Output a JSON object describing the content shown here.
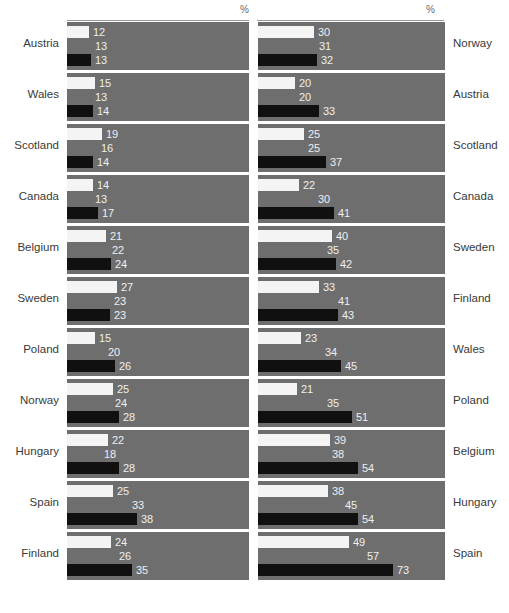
{
  "axis": {
    "unit_label_left": "%",
    "unit_label_right": "%"
  },
  "style": {
    "panel_background": "#6e6e6e",
    "series1_color": "#f4f4f4",
    "series2_color": "#6e6e6e",
    "series3_color": "#101010",
    "label_color": "#3a3a3a",
    "value_color": "#efefef"
  },
  "chart_data": {
    "type": "bar",
    "orientation": "horizontal",
    "title": "",
    "xlabel": "%",
    "ylabel": "",
    "grid": false,
    "legend_position": "none",
    "px_per_unit": 1.85,
    "panels": [
      {
        "name": "left",
        "unit": "%",
        "label_side": "left",
        "categories": [
          "Austria",
          "Wales",
          "Scotland",
          "Canada",
          "Belgium",
          "Sweden",
          "Poland",
          "Norway",
          "Hungary",
          "Spain",
          "Finland"
        ],
        "series": [
          {
            "name": "series-1",
            "color": "#f4f4f4",
            "values": [
              12,
              15,
              19,
              14,
              21,
              27,
              15,
              25,
              22,
              25,
              24
            ]
          },
          {
            "name": "series-2",
            "color": "#6e6e6e",
            "values": [
              13,
              13,
              16,
              13,
              22,
              23,
              20,
              24,
              18,
              33,
              26
            ]
          },
          {
            "name": "series-3",
            "color": "#101010",
            "values": [
              13,
              14,
              14,
              17,
              24,
              23,
              26,
              28,
              28,
              38,
              35
            ]
          }
        ]
      },
      {
        "name": "right",
        "unit": "%",
        "label_side": "right",
        "categories": [
          "Norway",
          "Austria",
          "Scotland",
          "Canada",
          "Sweden",
          "Finland",
          "Wales",
          "Poland",
          "Belgium",
          "Hungary",
          "Spain"
        ],
        "series": [
          {
            "name": "series-1",
            "color": "#f4f4f4",
            "values": [
              30,
              20,
              25,
              22,
              40,
              33,
              23,
              21,
              39,
              38,
              49
            ]
          },
          {
            "name": "series-2",
            "color": "#6e6e6e",
            "values": [
              31,
              20,
              25,
              30,
              35,
              41,
              34,
              35,
              38,
              45,
              57
            ]
          },
          {
            "name": "series-3",
            "color": "#101010",
            "values": [
              32,
              33,
              37,
              41,
              42,
              43,
              45,
              51,
              54,
              54,
              73
            ]
          }
        ]
      }
    ]
  }
}
